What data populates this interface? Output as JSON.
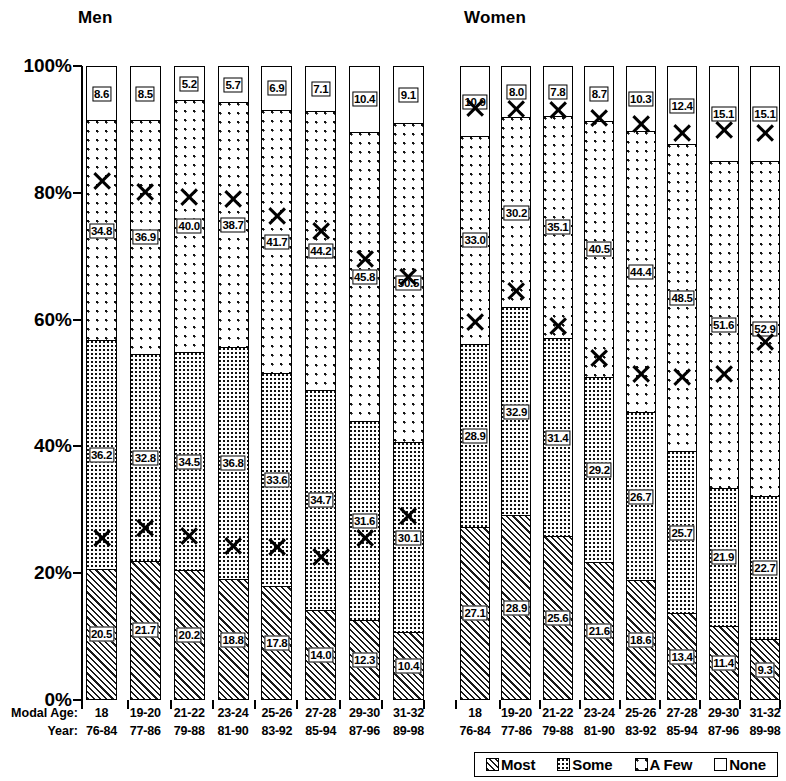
{
  "panels": {
    "men": {
      "title": "Men"
    },
    "women": {
      "title": "Women"
    }
  },
  "axis": {
    "y_label_row": "Modal Age:",
    "y_label_row2": "Year:",
    "yticks": [
      "100%",
      "80%",
      "60%",
      "40%",
      "20%",
      "0%"
    ],
    "ymin": 0,
    "ymax": 100
  },
  "legend": {
    "items": [
      {
        "label": "Most",
        "pattern": "diagonal-hatch"
      },
      {
        "label": "Some",
        "pattern": "dense-dots"
      },
      {
        "label": "A Few",
        "pattern": "sparse-dots"
      },
      {
        "label": "None",
        "pattern": "white"
      }
    ]
  },
  "chart_data": {
    "type": "bar",
    "subtype": "stacked-percent",
    "title": "",
    "xlabel": "Modal Age / Year",
    "ylabel": "",
    "ylim": [
      0,
      100
    ],
    "grid": false,
    "legend_position": "bottom-right",
    "panels": [
      {
        "name": "Men",
        "categories": [
          "18",
          "19-20",
          "21-22",
          "23-24",
          "25-26",
          "27-28",
          "29-30",
          "31-32"
        ],
        "years": [
          "76-84",
          "77-86",
          "79-88",
          "81-90",
          "83-92",
          "85-94",
          "87-96",
          "89-98"
        ],
        "series": [
          {
            "name": "Most",
            "values": [
              20.5,
              21.7,
              20.2,
              18.8,
              17.8,
              14.0,
              12.3,
              10.4
            ]
          },
          {
            "name": "Some",
            "values": [
              36.2,
              32.8,
              34.5,
              36.8,
              33.6,
              34.7,
              31.6,
              30.1
            ]
          },
          {
            "name": "A Few",
            "values": [
              34.8,
              36.9,
              40.0,
              38.7,
              41.7,
              44.2,
              45.8,
              50.5
            ]
          },
          {
            "name": "None",
            "values": [
              8.6,
              8.5,
              5.2,
              5.7,
              6.9,
              7.1,
              10.4,
              9.1
            ]
          }
        ],
        "markers": {
          "name": "X",
          "values": [
            78.5,
            76.8,
            75.9,
            75.6,
            73.0,
            70.5,
            66.2,
            63.3
          ]
        },
        "markers2": {
          "name": "X",
          "values": [
            22.0,
            23.6,
            22.3,
            20.8,
            20.5,
            19.0,
            22.0,
            25.5
          ]
        }
      },
      {
        "name": "Women",
        "categories": [
          "18",
          "19-20",
          "21-22",
          "23-24",
          "25-26",
          "27-28",
          "29-30",
          "31-32"
        ],
        "years": [
          "76-84",
          "77-86",
          "79-88",
          "81-90",
          "83-92",
          "85-94",
          "87-96",
          "89-98"
        ],
        "series": [
          {
            "name": "Most",
            "values": [
              27.1,
              28.9,
              25.6,
              21.6,
              18.6,
              13.4,
              11.4,
              9.3
            ]
          },
          {
            "name": "Some",
            "values": [
              28.9,
              32.9,
              31.4,
              29.2,
              26.7,
              25.7,
              21.9,
              22.7
            ]
          },
          {
            "name": "A Few",
            "values": [
              33.0,
              30.2,
              35.1,
              40.5,
              44.4,
              48.5,
              51.6,
              52.9
            ]
          },
          {
            "name": "None",
            "values": [
              10.9,
              8.0,
              7.8,
              8.7,
              10.3,
              12.4,
              15.1,
              15.1
            ]
          }
        ],
        "markers": {
          "name": "X",
          "values": [
            90.0,
            89.8,
            89.7,
            88.5,
            87.5,
            86.0,
            86.5,
            86.0
          ]
        },
        "markers2": {
          "name": "X",
          "values": [
            56.2,
            61.0,
            55.5,
            50.5,
            48.0,
            47.5,
            48.0,
            53.0
          ]
        }
      }
    ]
  }
}
